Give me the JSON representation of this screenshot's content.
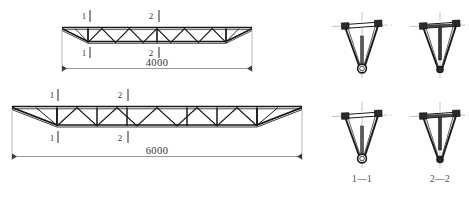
{
  "drawing": {
    "title": "Triangular space truss elevations and cross sections",
    "units": "mm",
    "line_color": "#1a1a1a",
    "dim_color": "#555555",
    "centerline_color": "#888888",
    "hatch_color": "#666666"
  },
  "elevations": [
    {
      "id": "truss-4000",
      "span_label": "4000",
      "span_value": 4000,
      "panels": 10,
      "section_marks": [
        {
          "label": "1",
          "position": "top-left"
        },
        {
          "label": "2",
          "position": "top-mid"
        },
        {
          "label": "1",
          "position": "bottom-left"
        },
        {
          "label": "2",
          "position": "bottom-mid"
        }
      ]
    },
    {
      "id": "truss-6000",
      "span_label": "6000",
      "span_value": 6000,
      "panels": 10,
      "section_marks": [
        {
          "label": "1",
          "position": "top-left"
        },
        {
          "label": "2",
          "position": "top-mid"
        },
        {
          "label": "1",
          "position": "bottom-left"
        },
        {
          "label": "2",
          "position": "bottom-mid"
        }
      ]
    }
  ],
  "sections": [
    {
      "id": "section-1-1-upper",
      "label": "",
      "caption_visible": false,
      "type": "v-truss-chord"
    },
    {
      "id": "section-2-2-upper",
      "label": "",
      "caption_visible": false,
      "type": "v-truss-web"
    },
    {
      "id": "section-1-1-lower",
      "label": "1—1",
      "caption_visible": true,
      "type": "v-truss-chord"
    },
    {
      "id": "section-2-2-lower",
      "label": "2—2",
      "caption_visible": true,
      "type": "v-truss-web"
    }
  ],
  "captions": {
    "section_1": "1—1",
    "section_2": "2—2"
  },
  "marks": {
    "one": "1",
    "two": "2"
  }
}
